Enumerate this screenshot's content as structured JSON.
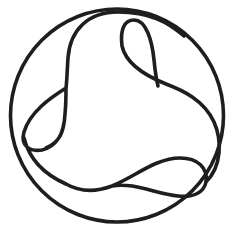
{
  "diagram": {
    "type": "knot-in-circle",
    "stroke_color": "#1e1e1e",
    "background_color": "#ffffff",
    "outer_circle": {
      "cx": 117,
      "cy": 115.5,
      "r": 106.5
    },
    "knot_path": "M 116 11 C 80 12 68 40 68 62 L 68 86 C 52 96 30 112 25 130 C 21 146 32 152 45 150 C 58 147 66 132 67 112 L 67 86 M 67 112 C 66 140 40 146 33 160 M 22 142 C 40 175 70 190 110 185 C 140 180 160 160 185 160 C 200 160 206 172 204 184 C 202 194 190 197 175 196 C 150 194 130 178 110 185 M 204 184 C 222 170 220 140 212 122 C 198 100 175 90 160 84 C 140 76 124 62 122 44 C 121 30 126 19 135 19 C 148 20 152 52 152 80 L 152 85 M 116 11 C 150 10 170 20 186 34"
  }
}
